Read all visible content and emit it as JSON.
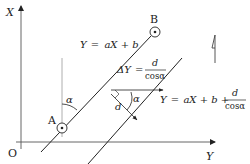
{
  "diagram": {
    "axes": {
      "x_label": "X",
      "y_label": "Y",
      "origin_label": "O"
    },
    "points": {
      "a_label": "A",
      "b_label": "B"
    },
    "lines": {
      "upper": {
        "eq_lhs": "Y",
        "eq_eq": "=",
        "eq_rhs": "aX + b"
      },
      "lower": {
        "eq_lhs": "Y",
        "eq_eq": "=",
        "eq_rhs": "aX + b +",
        "frac_num": "d",
        "frac_den": "cosα"
      }
    },
    "delta": {
      "lhs": "ΔY",
      "eq": "=",
      "frac_num": "d",
      "frac_den": "cosα"
    },
    "angles": {
      "alpha_at_a": "α",
      "alpha_mid": "α"
    },
    "distance_label": "d",
    "colors": {
      "stroke": "#222222",
      "light_stroke": "#888888",
      "background": "#ffffff"
    }
  }
}
